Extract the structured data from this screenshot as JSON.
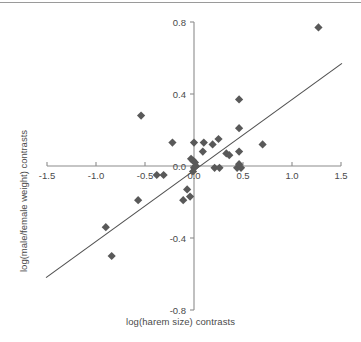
{
  "figure": {
    "background": "#ffffff",
    "top_rule_color": "#9a9a9a",
    "axis_color": "#8c8c8c",
    "marker_color": "#595959",
    "line_color": "#4f4f4f",
    "text_color": "#4a4a4a"
  },
  "chart_data": {
    "type": "scatter",
    "title": "",
    "xlabel": "log(harem size) contrasts",
    "ylabel": "log(male/female weight) contrasts",
    "xlim": [
      -1.5,
      1.5
    ],
    "ylim": [
      -0.8,
      0.8
    ],
    "xticks": [
      -1.5,
      -1.0,
      -0.5,
      0.0,
      0.5,
      1.0,
      1.5
    ],
    "xticklabels": [
      "-1.5",
      "-1.0",
      "-0.5",
      "0.0",
      "0.5",
      "1.0",
      "1.5"
    ],
    "yticks": [
      -0.8,
      -0.4,
      0.0,
      0.4,
      0.8
    ],
    "yticklabels": [
      "-0.8",
      "-0.4",
      "0.0",
      "0.4",
      "0.8"
    ],
    "grid": false,
    "legend": null,
    "marker": "diamond",
    "marker_size": 7,
    "points": [
      {
        "x": 1.27,
        "y": 0.77
      },
      {
        "x": 0.46,
        "y": 0.37
      },
      {
        "x": -0.54,
        "y": 0.28
      },
      {
        "x": 0.46,
        "y": 0.21
      },
      {
        "x": 0.25,
        "y": 0.15
      },
      {
        "x": 0.1,
        "y": 0.13
      },
      {
        "x": 0.19,
        "y": 0.12
      },
      {
        "x": -0.22,
        "y": 0.13
      },
      {
        "x": 0.0,
        "y": 0.13
      },
      {
        "x": 0.7,
        "y": 0.12
      },
      {
        "x": 0.09,
        "y": 0.08
      },
      {
        "x": 0.46,
        "y": 0.08
      },
      {
        "x": 0.33,
        "y": 0.07
      },
      {
        "x": 0.36,
        "y": 0.06
      },
      {
        "x": -0.03,
        "y": 0.04
      },
      {
        "x": -0.01,
        "y": 0.03
      },
      {
        "x": 0.01,
        "y": 0.02
      },
      {
        "x": 0.02,
        "y": 0.0
      },
      {
        "x": 0.0,
        "y": -0.01
      },
      {
        "x": 0.21,
        "y": -0.01
      },
      {
        "x": 0.26,
        "y": -0.01
      },
      {
        "x": 0.44,
        "y": -0.01
      },
      {
        "x": 0.48,
        "y": -0.01
      },
      {
        "x": 0.46,
        "y": 0.01
      },
      {
        "x": -0.01,
        "y": -0.03
      },
      {
        "x": -0.31,
        "y": -0.05
      },
      {
        "x": -0.38,
        "y": -0.05
      },
      {
        "x": -0.07,
        "y": -0.13
      },
      {
        "x": -0.04,
        "y": -0.17
      },
      {
        "x": -0.11,
        "y": -0.19
      },
      {
        "x": -0.57,
        "y": -0.19
      },
      {
        "x": -0.9,
        "y": -0.34
      },
      {
        "x": -0.84,
        "y": -0.5
      }
    ],
    "fit_line": {
      "type": "linear",
      "x_start": -1.51,
      "y_start": -0.62,
      "x_end": 1.51,
      "y_end": 0.57,
      "slope": 0.39,
      "intercept": -0.03
    }
  }
}
